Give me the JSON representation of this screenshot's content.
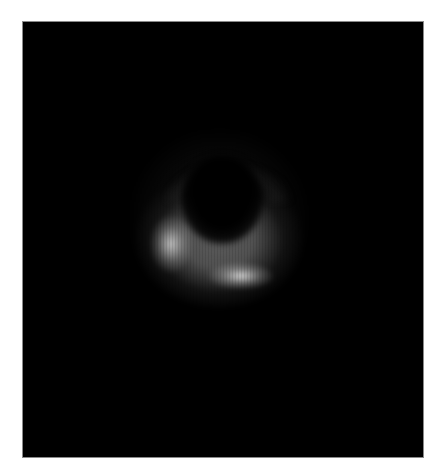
{
  "image": {
    "description": "Blurred bright ring (crescent brighter at bottom) with dark center on black background",
    "canvas": {
      "width": 442,
      "height": 475,
      "background": "#ffffff"
    },
    "panel": {
      "x": 22,
      "y": 21,
      "width": 402,
      "height": 437,
      "fill": "#000000",
      "border": "#8a8a8a"
    },
    "ring": {
      "center": [
        218,
        205
      ],
      "outer_radius": 82,
      "inner_radius": 30,
      "color": "#d8d8d8",
      "brightest_regions": [
        "lower-left",
        "bottom"
      ],
      "faintest_region": "top"
    }
  }
}
